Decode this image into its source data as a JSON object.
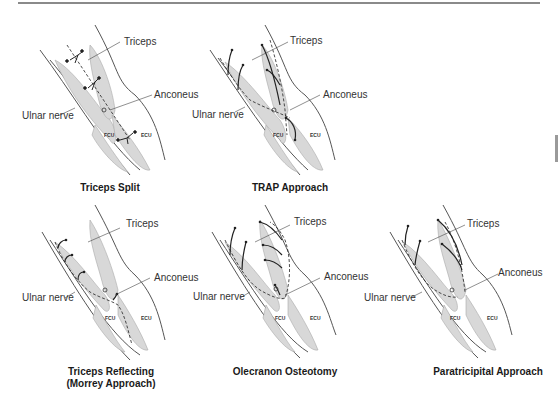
{
  "figure": {
    "panels": [
      {
        "id": "triceps-split",
        "caption": "Triceps Split",
        "labels": {
          "triceps": "Triceps",
          "anconeus": "Anconeus",
          "ulnar_nerve": "Ulnar nerve",
          "fcu": "FCU",
          "ecu": "ECU"
        }
      },
      {
        "id": "trap-approach",
        "caption": "TRAP Approach",
        "labels": {
          "triceps": "Triceps",
          "anconeus": "Anconeus",
          "ulnar_nerve": "Ulnar nerve",
          "fcu": "FCU",
          "ecu": "ECU"
        }
      },
      {
        "id": "triceps-reflecting",
        "caption_line1": "Triceps Reflecting",
        "caption_line2": "(Morrey Approach)",
        "labels": {
          "triceps": "Triceps",
          "anconeus": "Anconeus",
          "ulnar_nerve": "Ulnar nerve",
          "fcu": "FCU",
          "ecu": "ECU"
        }
      },
      {
        "id": "olecranon-osteotomy",
        "caption": "Olecranon Osteotomy",
        "labels": {
          "triceps": "Triceps",
          "anconeus": "Anconeus",
          "ulnar_nerve": "Ulnar nerve",
          "fcu": "FCU",
          "ecu": "ECU"
        }
      },
      {
        "id": "paratricipital-approach",
        "caption": "Paratricipital Approach",
        "labels": {
          "triceps": "Triceps",
          "anconeus": "Anconeus",
          "ulnar_nerve": "Ulnar nerve",
          "fcu": "FCU",
          "ecu": "ECU"
        }
      }
    ]
  }
}
